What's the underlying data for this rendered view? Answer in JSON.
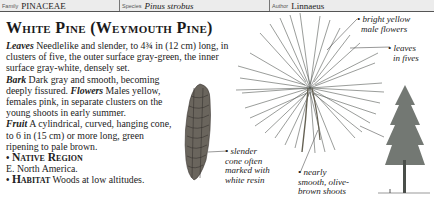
{
  "header": {
    "family_label": "Family",
    "family_value": "PINACEAE",
    "species_label": "Species",
    "species_value": "Pinus strobus",
    "author_label": "Author",
    "author_value": "Linnaeus"
  },
  "title": "White Pine (Weymouth Pine)",
  "description": {
    "leaves_label": "Leaves",
    "leaves_text": " Needlelike and slender, to 4¾ in (12 cm) long, in clusters of five, the outer surface gray-green, the inner surface gray-white, densely set.",
    "bark_label": "Bark",
    "bark_text": " Dark gray and smooth, becoming deeply fissured. ",
    "flowers_label": "Flowers",
    "flowers_text": " Males yellow, females pink, in separate clusters on the young shoots in early summer.",
    "fruit_label": "Fruit",
    "fruit_text": " A cylindrical, curved, hanging cone, to 6 in (15 cm) or more long, green ripening to pale brown.",
    "native_label": "Native Region",
    "native_text": "E. North America.",
    "habitat_label": "Habitat",
    "habitat_text": " Woods at low altitudes."
  },
  "annotations": {
    "male_flowers": "bright yellow male flowers",
    "male_flowers_l1": "• bright yellow",
    "male_flowers_l2": "male flowers",
    "leaves_fives_l1": "• leaves",
    "leaves_fives_l2": "in fives",
    "cone_l1": "• slender",
    "cone_l2": "cone often",
    "cone_l3": "marked with",
    "cone_l4": "white resin",
    "shoots_l1": "• nearly",
    "shoots_l2": "smooth, olive-",
    "shoots_l3": "brown shoots"
  },
  "bullet_glyph": "•",
  "colors": {
    "header_bg": "#ececec",
    "text": "#1a1a1a",
    "needle": "#3a3f3a",
    "cone": "#5a5650",
    "tree": "#4a4f4a"
  }
}
